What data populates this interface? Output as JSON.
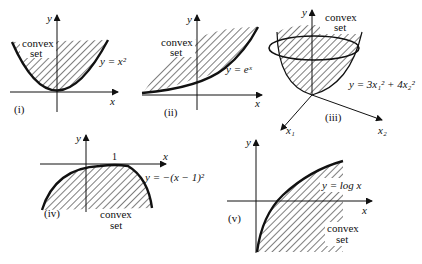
{
  "figure": {
    "background": "#ffffff",
    "ink": "#111111",
    "panels": [
      {
        "id": "i",
        "label": "(i)",
        "axes": {
          "x": "x",
          "y": "y"
        },
        "equation": "y = x²",
        "function": "x^2",
        "region_label": [
          "convex",
          "set"
        ]
      },
      {
        "id": "ii",
        "label": "(ii)",
        "axes": {
          "x": "x",
          "y": "y"
        },
        "equation": "y = eˣ",
        "function": "e^x",
        "region_label": [
          "convex",
          "set"
        ]
      },
      {
        "id": "iii",
        "label": "(iii)",
        "axes": {
          "x1": "x₁",
          "x2": "x₂",
          "y": "y"
        },
        "equation": "y = 3x₁² + 4x₂²",
        "function": "3x1^2 + 4x2^2",
        "region_label": [
          "convex",
          "set"
        ]
      },
      {
        "id": "iv",
        "label": "(iv)",
        "axes": {
          "x": "x",
          "y": "y"
        },
        "tick": "1",
        "equation": "y = −(x − 1)²",
        "function": "-(x-1)^2",
        "region_label": [
          "convex",
          "set"
        ]
      },
      {
        "id": "v",
        "label": "(v)",
        "axes": {
          "x": "x",
          "y": "y"
        },
        "equation": "y = log x",
        "function": "log x",
        "region_label": [
          "convex",
          "set"
        ]
      }
    ]
  }
}
